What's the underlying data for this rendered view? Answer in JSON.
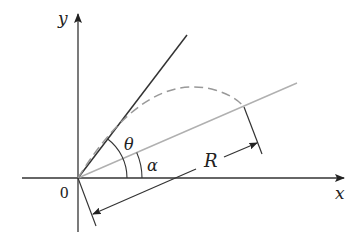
{
  "diagram": {
    "type": "projectile-on-inclined-plane",
    "labels": {
      "y_axis": "y",
      "x_axis": "x",
      "origin": "0",
      "theta": "θ",
      "alpha": "α",
      "range": "R"
    },
    "colors": {
      "axes": "#333333",
      "launch_line": "#333333",
      "incline_line": "#b0b0b0",
      "trajectory": "#999999",
      "dimension": "#333333",
      "background": "#ffffff"
    },
    "elements": [
      "x-axis with arrow",
      "y-axis with arrow",
      "launch direction line at angle theta",
      "inclined plane line at angle alpha",
      "dashed parabolic trajectory",
      "angle arc theta",
      "angle arc alpha",
      "range dimension R with extension lines"
    ]
  }
}
